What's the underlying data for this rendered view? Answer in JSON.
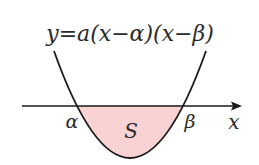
{
  "diagram": {
    "type": "parabola-area",
    "equation": "y=a(x−α)(x−β)",
    "root_left_label": "α",
    "root_right_label": "β",
    "axis_label": "x",
    "region_label": "S",
    "colors": {
      "curve": "#1a1a1a",
      "axis": "#1a1a1a",
      "fill": "#f9d3d3",
      "text": "#2a2a2a"
    }
  }
}
